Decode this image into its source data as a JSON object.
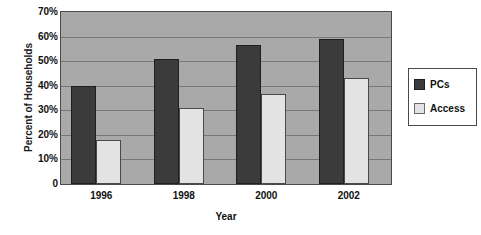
{
  "chart_data": {
    "type": "bar",
    "title": "",
    "xlabel": "Year",
    "ylabel": "Percent of Households",
    "categories": [
      "1996",
      "1998",
      "2000",
      "2002"
    ],
    "series": [
      {
        "name": "PCs",
        "color": "#3b3b3b",
        "values": [
          40,
          51,
          56.5,
          59
        ]
      },
      {
        "name": "Access",
        "color": "#e3e3e3",
        "values": [
          18,
          31,
          36.5,
          43
        ]
      }
    ],
    "ylim": [
      0,
      70
    ],
    "ytick_labels": [
      "70%",
      "60%",
      "50%",
      "40%",
      "30%",
      "20%",
      "10%",
      "0"
    ],
    "ytick_values": [
      70,
      60,
      50,
      40,
      30,
      20,
      10,
      0
    ],
    "grid": true,
    "legend_position": "right",
    "plot_background": "#a9a9a9",
    "gridline_color": "#787878"
  }
}
